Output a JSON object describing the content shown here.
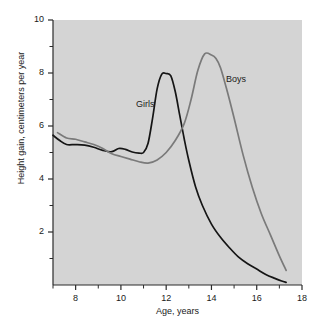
{
  "chart_data": {
    "type": "line",
    "title": "",
    "subtitle": "",
    "xlabel": "Age, years",
    "ylabel": "Height gain, centimeters per year",
    "xlim": [
      7,
      18
    ],
    "ylim": [
      0,
      10
    ],
    "xticks": [
      8,
      10,
      12,
      14,
      16,
      18
    ],
    "xtick_labels": [
      "8",
      "10",
      "12",
      "14",
      "16",
      "18"
    ],
    "yticks": [
      2,
      4,
      6,
      8,
      10
    ],
    "ytick_labels": [
      "2",
      "4",
      "6",
      "8",
      "10"
    ],
    "x_minor_ticks": [
      7,
      9,
      11,
      13,
      15,
      17
    ],
    "y_minor_ticks": [
      1,
      3,
      5,
      7,
      9
    ],
    "grid": false,
    "legend_position": "inline-annotation",
    "plot_background": "#d4d4d4",
    "series": [
      {
        "name": "Girls",
        "color": "#151515",
        "label_x": 11.0,
        "label_y": 7.0,
        "x": [
          7.0,
          7.3,
          7.6,
          8.0,
          8.4,
          8.8,
          9.2,
          9.6,
          9.9,
          10.2,
          10.5,
          10.8,
          11.0,
          11.2,
          11.4,
          11.6,
          11.8,
          12.0,
          12.2,
          12.4,
          12.6,
          12.8,
          13.0,
          13.3,
          13.6,
          14.0,
          14.4,
          14.8,
          15.2,
          15.6,
          16.0,
          16.4,
          16.8,
          17.1,
          17.3
        ],
        "y": [
          5.65,
          5.45,
          5.3,
          5.3,
          5.28,
          5.2,
          5.08,
          5.03,
          5.15,
          5.12,
          5.02,
          4.98,
          5.0,
          5.35,
          6.3,
          7.4,
          7.95,
          7.98,
          7.9,
          7.3,
          6.4,
          5.5,
          4.7,
          3.7,
          3.0,
          2.3,
          1.8,
          1.4,
          1.05,
          0.8,
          0.6,
          0.4,
          0.25,
          0.15,
          0.1
        ]
      },
      {
        "name": "Boys",
        "color": "#7a7a7a",
        "label_x": 15.1,
        "label_y": 7.6,
        "x": [
          7.2,
          7.6,
          8.0,
          8.4,
          8.8,
          9.2,
          9.6,
          10.0,
          10.4,
          10.8,
          11.2,
          11.6,
          12.0,
          12.4,
          12.8,
          13.1,
          13.4,
          13.7,
          14.0,
          14.2,
          14.4,
          14.7,
          15.0,
          15.4,
          15.8,
          16.2,
          16.6,
          17.0,
          17.3
        ],
        "y": [
          5.75,
          5.55,
          5.5,
          5.4,
          5.3,
          5.15,
          4.95,
          4.85,
          4.75,
          4.65,
          4.6,
          4.72,
          5.0,
          5.45,
          6.1,
          7.0,
          8.1,
          8.72,
          8.68,
          8.55,
          8.2,
          7.3,
          6.3,
          4.9,
          3.7,
          2.7,
          1.9,
          1.1,
          0.55
        ]
      }
    ]
  }
}
